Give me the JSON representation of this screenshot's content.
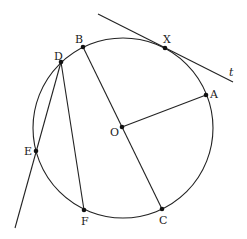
{
  "diagram": {
    "type": "circle-geometry",
    "circle": {
      "center_label": "O",
      "cx": 123,
      "cy": 128,
      "r": 90
    },
    "points": {
      "A": {
        "label": "A",
        "x": 206,
        "y": 95
      },
      "B": {
        "label": "B",
        "x": 83,
        "y": 47
      },
      "C": {
        "label": "C",
        "x": 162,
        "y": 209
      },
      "D": {
        "label": "D",
        "x": 61,
        "y": 62
      },
      "E": {
        "label": "E",
        "x": 36,
        "y": 151
      },
      "F": {
        "label": "F",
        "x": 84,
        "y": 210
      },
      "O": {
        "label": "O",
        "x": 122,
        "y": 127
      },
      "X": {
        "label": "X",
        "x": 165,
        "y": 48
      }
    },
    "tangent_line": {
      "label": "t",
      "through": "X"
    },
    "segments": [
      "B-C",
      "O-A",
      "D-F",
      "D-E (extended)"
    ]
  }
}
